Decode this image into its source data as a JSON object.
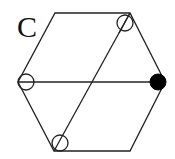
{
  "panel": {
    "label": "C"
  },
  "diagram": {
    "shape": "hexagon",
    "stroke_color": "#222222",
    "fill_marker_color": "#000000",
    "vertices": {
      "top_left": [
        55,
        13
      ],
      "top_right": [
        130,
        13
      ],
      "right": [
        165,
        82
      ],
      "bottom_right": [
        130,
        151
      ],
      "bottom_left": [
        54,
        151
      ],
      "left": [
        18,
        82
      ]
    },
    "internal_lines": [
      {
        "name": "horizontal-diagonal",
        "from": "left",
        "to": "right"
      },
      {
        "name": "slanted-diagonal",
        "from": "top_right",
        "to": "bottom_left"
      }
    ],
    "markers": [
      {
        "name": "top-right-marker",
        "type": "open-slashed",
        "cx": 125,
        "cy": 23
      },
      {
        "name": "left-marker",
        "type": "open-horizontal",
        "cx": 26,
        "cy": 82
      },
      {
        "name": "right-marker",
        "type": "filled",
        "cx": 158,
        "cy": 82
      },
      {
        "name": "bottom-left-marker",
        "type": "open-slashed",
        "cx": 60,
        "cy": 143
      }
    ]
  }
}
